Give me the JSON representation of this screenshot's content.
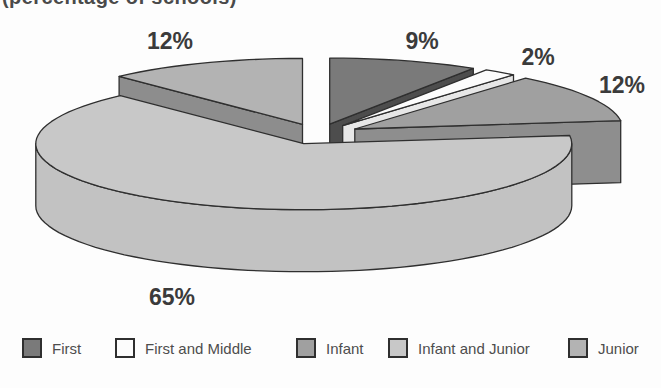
{
  "caption_clipped": "(percentage of schools)",
  "chart_data": {
    "type": "pie",
    "three_d": true,
    "exploded": true,
    "title": "(percentage of schools)",
    "legend_position": "bottom",
    "slices": [
      {
        "label": "First",
        "value": 9,
        "pct_label": "9%",
        "color": "#7a7a7a",
        "side": "#4d4d4d",
        "wall": "#6a6a6a"
      },
      {
        "label": "First and Middle",
        "value": 2,
        "pct_label": "2%",
        "color": "#fcfcfc",
        "side": "#e7e7e7",
        "wall": "#eeeeee"
      },
      {
        "label": "Infant",
        "value": 12,
        "pct_label": "12%",
        "color": "#a0a0a0",
        "side": "#8e8e8e",
        "wall": "#8e8e8e"
      },
      {
        "label": "Infant and Junior",
        "value": 65,
        "pct_label": "65%",
        "color": "#c8c8c8",
        "side": "#bfbfbf",
        "wall": "#c2c2c2"
      },
      {
        "label": "Junior",
        "value": 12,
        "pct_label": "12%",
        "color": "#b3b3b3",
        "side": "#8d8d8d",
        "wall": "#a6a6a6"
      }
    ]
  }
}
